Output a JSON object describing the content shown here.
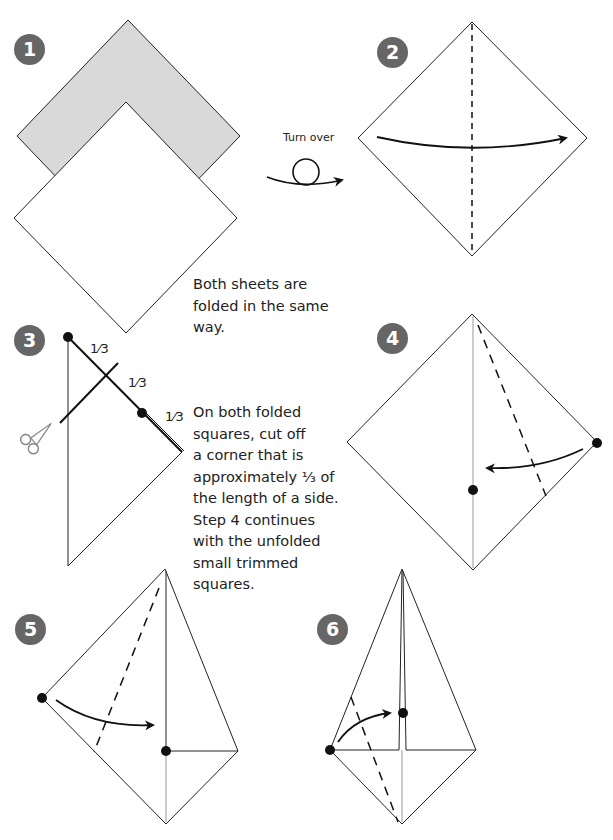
{
  "steps": [
    {
      "number": "1"
    },
    {
      "number": "2"
    },
    {
      "number": "3"
    },
    {
      "number": "4"
    },
    {
      "number": "5"
    },
    {
      "number": "6"
    }
  ],
  "labels": {
    "turn_over": "Turn over",
    "fraction": "1⁄3"
  },
  "captions": {
    "step1": [
      "Both sheets are",
      "folded in the same",
      "way."
    ],
    "step3": [
      "On both folded",
      "squares, cut off",
      "a corner that is",
      "approximately ⅓ of",
      "the length of a side.",
      "Step 4 continues",
      "with the unfolded",
      "small trimmed",
      "squares."
    ]
  },
  "colors": {
    "badge": "#666666",
    "paper_back": "#d9d9d9",
    "line": "#222222"
  }
}
